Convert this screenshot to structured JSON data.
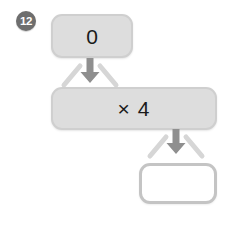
{
  "page": {
    "background_color": "#ffffff",
    "width": 233,
    "height": 227
  },
  "question": {
    "number_label": "12",
    "badge_color": "#6e6e6e",
    "badge_text_color": "#ffffff"
  },
  "diagram": {
    "type": "function-machine-flowchart",
    "direction": "top-to-bottom",
    "nodes": [
      {
        "id": "input",
        "role": "input-value",
        "label": "0",
        "fill_color": "#dddddd",
        "border_color": "#cfcfcf",
        "filled": true
      },
      {
        "id": "operation",
        "role": "operation-rule",
        "label": "× 4",
        "fill_color": "#dddddd",
        "border_color": "#cfcfcf",
        "filled": true
      },
      {
        "id": "output",
        "role": "answer-blank",
        "label": "",
        "fill_color": "#ffffff",
        "border_color": "#c4c4c4",
        "filled": false
      }
    ],
    "connectors": [
      {
        "id": "connector-1",
        "from": "input",
        "to": "operation",
        "icon": "down-arrow-icon",
        "arrow_color": "#8f8f8f",
        "funnel_color": "#d6d6d6"
      },
      {
        "id": "connector-2",
        "from": "operation",
        "to": "output",
        "icon": "down-arrow-icon",
        "arrow_color": "#8f8f8f",
        "funnel_color": "#d6d6d6"
      }
    ]
  }
}
